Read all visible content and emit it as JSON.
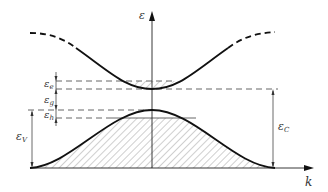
{
  "diagram": {
    "type": "band-structure",
    "axes": {
      "vertical_label": "ε",
      "horizontal_label": "k"
    },
    "labels": {
      "e": {
        "symbol": "ε",
        "subscript": "e"
      },
      "g": {
        "symbol": "ε",
        "subscript": "g"
      },
      "h": {
        "symbol": "ε",
        "subscript": "h"
      },
      "V": {
        "symbol": "ε",
        "subscript": "V"
      },
      "C": {
        "symbol": "ε",
        "subscript": "C"
      }
    },
    "curves": [
      {
        "name": "conduction-band",
        "style": "solid center, dashed ends",
        "minimum_at_k": 0
      },
      {
        "name": "valence-band",
        "style": "solid",
        "maximum_at_k": 0
      }
    ],
    "colors": {
      "line": "#1a1a1a",
      "dashed": "#555555",
      "hatch": "#777777"
    }
  }
}
